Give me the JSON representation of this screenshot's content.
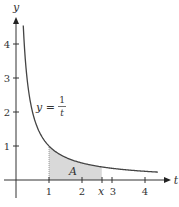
{
  "chart_data": {
    "type": "line",
    "title": "",
    "xlabel": "t",
    "ylabel": "y",
    "xlim": [
      -0.45,
      4.6
    ],
    "ylim": [
      -0.6,
      4.8
    ],
    "grid": false,
    "legend": null,
    "x_ticks": [
      1,
      2,
      3,
      4
    ],
    "x_tick_labels": [
      "1",
      "2",
      "3",
      "4"
    ],
    "y_ticks": [
      1,
      2,
      3,
      4
    ],
    "y_tick_labels": [
      "1",
      "2",
      "3",
      "4"
    ],
    "series": [
      {
        "name": "y = 1/t",
        "function": "1/t",
        "x": [
          0.22,
          0.25,
          0.3,
          0.4,
          0.5,
          0.6,
          0.75,
          1.0,
          1.25,
          1.5,
          2.0,
          2.5,
          3.0,
          3.5,
          4.0,
          4.3
        ],
        "y": [
          4.55,
          4.0,
          3.33,
          2.5,
          2.0,
          1.67,
          1.33,
          1.0,
          0.8,
          0.67,
          0.5,
          0.4,
          0.33,
          0.29,
          0.25,
          0.23
        ]
      }
    ],
    "shaded_region": {
      "label": "A",
      "from": 1,
      "to_label": "x",
      "to_estimate": 2.6,
      "under": "y = 1/t",
      "color": "#d9d9d9"
    },
    "annotations": [
      {
        "text": "y =",
        "fraction": {
          "num": "1",
          "den": "t"
        },
        "at": [
          0.7,
          2.0
        ]
      },
      {
        "text": "A",
        "at": [
          1.7,
          0.25
        ]
      },
      {
        "text": "x",
        "at": [
          2.6,
          -0.3
        ],
        "type": "x-tick-label"
      }
    ]
  },
  "labels": {
    "y_axis": "y",
    "x_axis": "t",
    "curve_eq_prefix": "y =",
    "curve_num": "1",
    "curve_den": "t",
    "area": "A",
    "x_marker": "x",
    "xt": [
      "1",
      "2",
      "3",
      "4"
    ],
    "yt": [
      "1",
      "2",
      "3",
      "4"
    ]
  },
  "colors": {
    "axis": "#333333",
    "curve": "#444444",
    "shade": "#d9d9d9"
  }
}
